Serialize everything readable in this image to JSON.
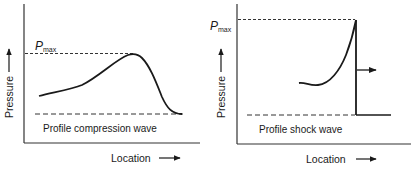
{
  "panels": [
    {
      "id": "compression",
      "caption": "Profile compression wave",
      "ylabel": "Pressure",
      "xlabel": "Location",
      "pmax_label": "P",
      "pmax_sub": "max"
    },
    {
      "id": "shock",
      "caption": "Profile shock wave",
      "ylabel": "Pressure",
      "xlabel": "Location",
      "pmax_label": "P",
      "pmax_sub": "max"
    }
  ],
  "colors": {
    "line": "#1a1a1a",
    "background": "#ffffff"
  }
}
